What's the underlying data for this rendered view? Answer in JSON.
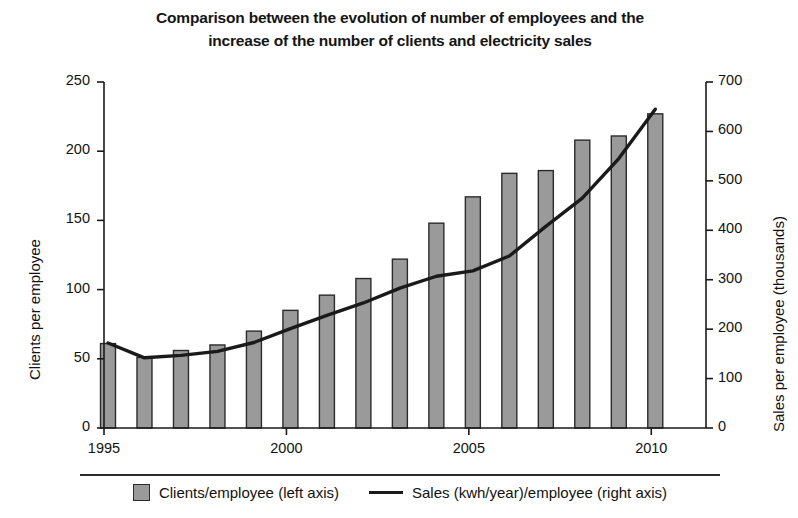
{
  "title": {
    "line1": "Comparison between the evolution of number of employees and the",
    "line2": "increase of the number of clients and electricity sales"
  },
  "legend": {
    "bar_label": "Clients/employee (left axis)",
    "line_label": "Sales (kwh/year)/employee (right axis)",
    "bar_color": "#9a9a9a",
    "line_color": "#1a1a1a"
  },
  "chart_data": {
    "type": "bar",
    "title": "Comparison between the evolution of number of employees and the increase of the number of clients and electricity sales",
    "xlabel": "",
    "ylabel": "Clients per employee",
    "y2label": "Sales per employee (thousands)",
    "xlim": [
      1995,
      2011.5
    ],
    "ylim": [
      0,
      250
    ],
    "y2lim": [
      0,
      700
    ],
    "x_ticks": [
      1995,
      2000,
      2005,
      2010
    ],
    "x_tick_labels": [
      "1995",
      "2000",
      "2005",
      "2010"
    ],
    "y_ticks": [
      0,
      50,
      100,
      150,
      200,
      250
    ],
    "y_tick_labels": [
      "0",
      "50",
      "100",
      "150",
      "200",
      "250"
    ],
    "y2_ticks": [
      0,
      100,
      200,
      300,
      400,
      500,
      600,
      700
    ],
    "y2_tick_labels": [
      "0",
      "100",
      "200",
      "300",
      "400",
      "500",
      "600",
      "700"
    ],
    "grid": false,
    "legend_position": "bottom",
    "x": [
      1995,
      1996,
      1997,
      1998,
      1999,
      2000,
      2001,
      2002,
      2003,
      2004,
      2005,
      2006,
      2007,
      2008,
      2009,
      2010
    ],
    "series": [
      {
        "name": "Clients/employee (left axis)",
        "type": "bar",
        "axis": "left",
        "color": "#9a9a9a",
        "values": [
          61,
          51,
          56,
          60,
          70,
          85,
          96,
          108,
          122,
          148,
          167,
          184,
          186,
          208,
          211,
          227
        ]
      },
      {
        "name": "Sales (kwh/year)/employee (right axis)",
        "type": "line",
        "axis": "right",
        "color": "#1a1a1a",
        "values": [
          172,
          142,
          147,
          155,
          173,
          201,
          228,
          253,
          283,
          307,
          318,
          348,
          408,
          465,
          545,
          645
        ]
      }
    ]
  }
}
